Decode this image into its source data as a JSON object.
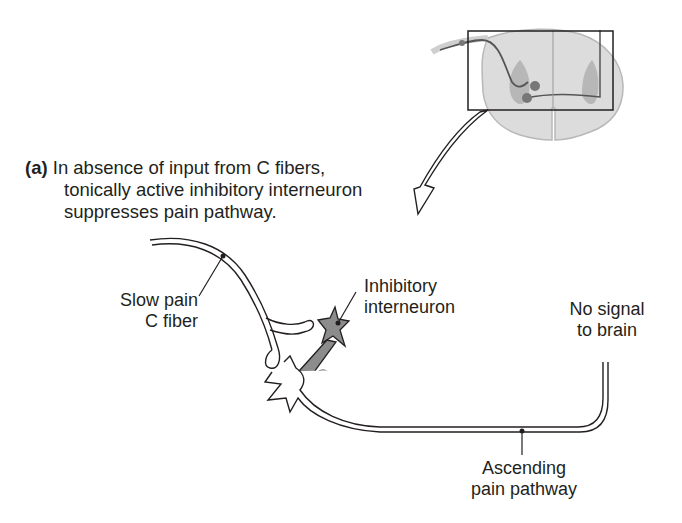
{
  "figure": {
    "part_tag": "(a)",
    "caption_lines": [
      "In absence of input from C fibers,",
      "tonically active inhibitory interneuron",
      "suppresses pain pathway."
    ]
  },
  "labels": {
    "slow_pain_fiber": [
      "Slow pain",
      "C fiber"
    ],
    "inhibitory_interneuron": [
      "Inhibitory",
      "interneuron"
    ],
    "no_signal": [
      "No signal",
      "to brain"
    ],
    "ascending_pathway": [
      "Ascending",
      "pain pathway"
    ],
    "inhibition_symbol": "−"
  },
  "inset": {
    "description": "spinal cord cross-section with highlighted dorsal horn region",
    "highlight_box": true
  },
  "colors": {
    "line": "#231f20",
    "interneuron_fill": "#8c8c8c",
    "cord_gray": "#d9d9d9",
    "cord_dark": "#a9a9a9",
    "inhibit_circle": "#6d6d6d"
  }
}
